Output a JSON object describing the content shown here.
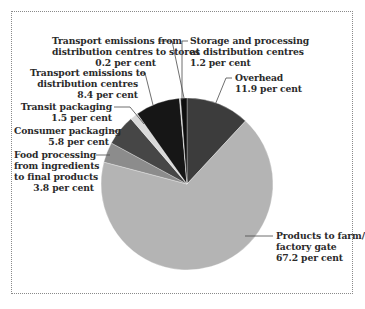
{
  "chart_data": {
    "type": "pie",
    "title": "",
    "start_angle_deg": 0,
    "direction": "clockwise",
    "slices": [
      {
        "label": "Overhead",
        "value": 11.9,
        "unit": "per cent",
        "color": "#3c3c3c"
      },
      {
        "label": "Products to farm/ factory gate",
        "value": 67.2,
        "unit": "per cent",
        "color": "#b4b4b4"
      },
      {
        "label": "Food processing from ingredients to final products",
        "value": 3.8,
        "unit": "per cent",
        "color": "#8c8c8c"
      },
      {
        "label": "Consumer packaging",
        "value": 5.8,
        "unit": "per cent",
        "color": "#464646"
      },
      {
        "label": "Transit packaging",
        "value": 1.5,
        "unit": "per cent",
        "color": "#d9d9d9"
      },
      {
        "label": "Transport emissions to distribution centres",
        "value": 8.4,
        "unit": "per cent",
        "color": "#161616"
      },
      {
        "label": "Transport emissions from distribution centres to stores",
        "value": 0.2,
        "unit": "per cent",
        "color": "#d0d0d0"
      },
      {
        "label": "Storage and processing at distribution centres",
        "value": 1.2,
        "unit": "per cent",
        "color": "#0e0e0e"
      }
    ]
  },
  "labels": {
    "transport_from": {
      "line1": "Transport emissions from",
      "line2": "distribution centres to stores",
      "value": "0.2 per cent"
    },
    "storage": {
      "line1": "Storage and processing",
      "line2": "at distribution centres",
      "value": "1.2 per cent"
    },
    "transport_to": {
      "line1": "Transport emissions to",
      "line2": "distribution centres",
      "value": "8.4 per cent"
    },
    "overhead": {
      "line1": "Overhead",
      "value": "11.9 per cent"
    },
    "transit": {
      "line1": "Transit packaging",
      "value": "1.5 per cent"
    },
    "consumer": {
      "line1": "Consumer packaging",
      "value": "5.8 per cent"
    },
    "food": {
      "line1": "Food processing",
      "line2": "from ingredients",
      "line3": "to final products",
      "value": "3.8 per cent"
    },
    "products": {
      "line1": "Products to farm/",
      "line2": "factory gate",
      "value": "67.2 per cent"
    }
  }
}
